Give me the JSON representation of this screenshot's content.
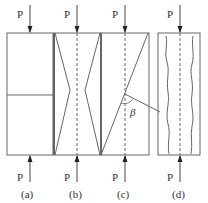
{
  "figure": {
    "load_label": "P",
    "panels": [
      {
        "id": "a",
        "caption": "(a)",
        "description": "specimen with horizontal split line"
      },
      {
        "id": "b",
        "caption": "(b)",
        "description": "double-cone (hourglass) failure"
      },
      {
        "id": "c",
        "caption": "(c)",
        "description": "inclined shear failure"
      },
      {
        "id": "d",
        "caption": "(d)",
        "description": "longitudinal splitting"
      }
    ],
    "angle_label": "β",
    "colors": {
      "line": "#555555",
      "background": "#ffffff"
    }
  }
}
